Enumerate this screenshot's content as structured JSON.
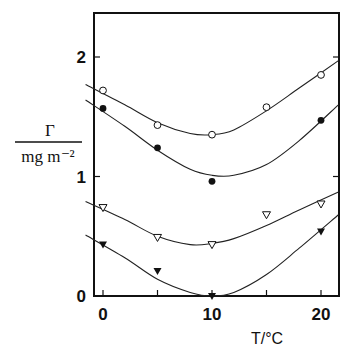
{
  "chart_data": {
    "type": "scatter",
    "title": "",
    "xlabel": "T/°C",
    "ylabel_numerator": "Γ",
    "ylabel_denominator": "mg m⁻²",
    "xlim": [
      -1.6,
      21.6
    ],
    "ylim": [
      0,
      2.4
    ],
    "xticks": [
      0,
      5,
      10,
      15,
      20
    ],
    "xtick_labels": [
      "0",
      "10",
      "20"
    ],
    "yticks": [
      0,
      1,
      2
    ],
    "ytick_labels": [
      "0",
      "1",
      "2"
    ],
    "grid": false,
    "legend": null,
    "series": [
      {
        "name": "open circles",
        "marker": "circle-open",
        "points": [
          [
            0,
            1.72
          ],
          [
            5,
            1.43
          ],
          [
            10,
            1.35
          ],
          [
            15,
            1.58
          ],
          [
            20,
            1.85
          ]
        ],
        "curve": [
          [
            -1.6,
            1.77
          ],
          [
            2,
            1.6
          ],
          [
            5,
            1.45
          ],
          [
            8,
            1.36
          ],
          [
            10,
            1.35
          ],
          [
            12,
            1.39
          ],
          [
            15,
            1.55
          ],
          [
            18,
            1.74
          ],
          [
            21.6,
            1.97
          ]
        ]
      },
      {
        "name": "filled circles",
        "marker": "circle-filled",
        "points": [
          [
            0,
            1.57
          ],
          [
            5,
            1.24
          ],
          [
            10,
            0.96
          ],
          [
            20,
            1.47
          ]
        ],
        "curve": [
          [
            -1.6,
            1.64
          ],
          [
            2,
            1.42
          ],
          [
            5,
            1.22
          ],
          [
            8,
            1.06
          ],
          [
            10,
            1.01
          ],
          [
            12,
            1.01
          ],
          [
            15,
            1.1
          ],
          [
            18,
            1.3
          ],
          [
            21.6,
            1.6
          ]
        ]
      },
      {
        "name": "open triangles",
        "marker": "triangle-down-open",
        "points": [
          [
            0,
            0.74
          ],
          [
            5,
            0.49
          ],
          [
            10,
            0.43
          ],
          [
            15,
            0.68
          ],
          [
            20,
            0.77
          ]
        ],
        "curve": [
          [
            -1.6,
            0.79
          ],
          [
            2,
            0.64
          ],
          [
            5,
            0.5
          ],
          [
            8,
            0.43
          ],
          [
            10,
            0.44
          ],
          [
            12,
            0.48
          ],
          [
            15,
            0.59
          ],
          [
            18,
            0.72
          ],
          [
            21.6,
            0.87
          ]
        ]
      },
      {
        "name": "filled triangles",
        "marker": "triangle-down-filled",
        "points": [
          [
            0,
            0.43
          ],
          [
            5,
            0.21
          ],
          [
            10,
            0.0
          ],
          [
            20,
            0.54
          ]
        ],
        "curve": [
          [
            -1.6,
            0.51
          ],
          [
            2,
            0.32
          ],
          [
            5,
            0.14
          ],
          [
            8,
            0.03
          ],
          [
            10,
            0.0
          ],
          [
            12,
            0.03
          ],
          [
            15,
            0.18
          ],
          [
            18,
            0.4
          ],
          [
            21.6,
            0.68
          ]
        ]
      }
    ]
  }
}
